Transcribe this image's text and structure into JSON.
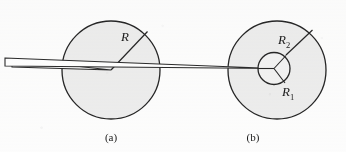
{
  "figure": {
    "width": 346,
    "height": 152,
    "background_color": "#fdfdfd",
    "stroke_color": "#262626",
    "disk_fill_color": "#ededed",
    "inner_disk_fill_color": "#f2f2f2"
  },
  "panel_a": {
    "caption": "(a)",
    "caption_x": 111,
    "caption_y": 141,
    "circle": {
      "cx": 111,
      "cy": 70,
      "r": 49
    },
    "radius_line": {
      "x1": 111,
      "y1": 70,
      "x2": 147.5,
      "y2": 31.5
    },
    "radius_label": {
      "text": "R",
      "x": 121,
      "y": 41
    },
    "needle": {
      "tip_x": 111,
      "tip_y": 70,
      "base_x": 12,
      "base_top_y": 59,
      "base_bottom_y": 67
    }
  },
  "panel_b": {
    "caption": "(b)",
    "caption_x": 253,
    "caption_y": 141,
    "outer_circle": {
      "cx": 277,
      "cy": 70,
      "r": 49
    },
    "inner_circle": {
      "cx": 274,
      "cy": 68.5,
      "r": 16
    },
    "outer_radius_line": {
      "x1": 286,
      "y1": 55,
      "x2": 312.5,
      "y2": 30
    },
    "outer_radius_label": {
      "text": "R",
      "subscript": "2",
      "x": 278,
      "y": 44
    },
    "inner_radius_label": {
      "text": "R",
      "subscript": "1",
      "x": 282,
      "y": 96
    },
    "spokes": [
      {
        "x1": 274,
        "y1": 68.5,
        "x2": 286,
        "y2": 55.5
      },
      {
        "x1": 274,
        "y1": 68.5,
        "x2": 285,
        "y2": 83
      },
      {
        "x1": 274,
        "y1": 68.5,
        "x2": 258,
        "y2": 68.5
      }
    ],
    "needle": {
      "tip_x": 274,
      "tip_y": 68.5,
      "base_x": 5,
      "base_top_y": 58,
      "base_bottom_y": 66
    }
  }
}
